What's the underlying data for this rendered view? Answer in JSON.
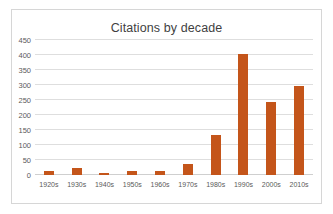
{
  "chart_data": {
    "type": "bar",
    "title": "Citations by decade",
    "xlabel": "",
    "ylabel": "",
    "categories": [
      "1920s",
      "1930s",
      "1940s",
      "1950s",
      "1960s",
      "1970s",
      "1980s",
      "1990s",
      "2000s",
      "2010s"
    ],
    "values": [
      12,
      24,
      6,
      14,
      12,
      36,
      133,
      402,
      245,
      298
    ],
    "ylim": [
      0,
      450
    ],
    "yticks": [
      0,
      50,
      100,
      150,
      200,
      250,
      300,
      350,
      400,
      450
    ],
    "ytick_labels": [
      "0",
      "50",
      "100",
      "150",
      "200",
      "250",
      "300",
      "350",
      "400",
      "450"
    ],
    "grid": true,
    "legend": false,
    "series_color": "#C4551A",
    "gridline_color": "#DEDEDE",
    "border_color": "#D6D6D6",
    "title_color": "#3F3F3F",
    "tick_color": "#5A5A5A"
  }
}
